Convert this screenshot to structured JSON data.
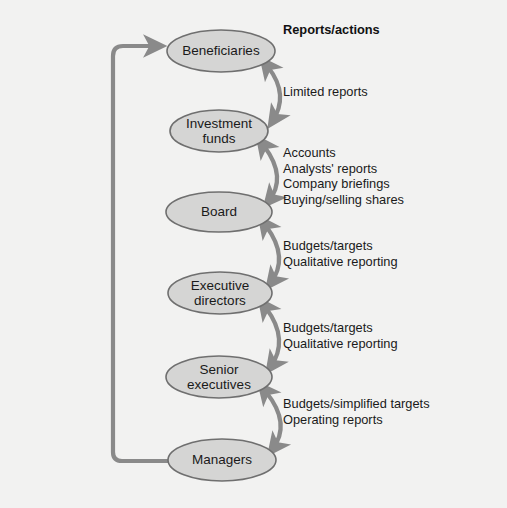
{
  "diagram": {
    "title": "Reports/actions",
    "background_color": "#f2f2f1",
    "node_fill_color": "#d5d5d4",
    "node_stroke_color": "#6f6f6f",
    "arrow_color": "#8a8a8a",
    "text_color": "#1a1a1a",
    "header": {
      "label": "Reports/actions",
      "x": 283,
      "y": 22
    },
    "nodes": [
      {
        "id": "beneficiaries",
        "label": "Beneficiaries",
        "cx": 221,
        "cy": 51,
        "rx": 54,
        "ry": 21
      },
      {
        "id": "investment-funds",
        "label": "Investment\nfunds",
        "cx": 219,
        "cy": 131,
        "rx": 49,
        "ry": 21
      },
      {
        "id": "board",
        "label": "Board",
        "cx": 219,
        "cy": 212,
        "rx": 53,
        "ry": 20
      },
      {
        "id": "executive-directors",
        "label": "Executive\ndirectors",
        "cx": 220,
        "cy": 293,
        "rx": 52,
        "ry": 21
      },
      {
        "id": "senior-executives",
        "label": "Senior\nexecutives",
        "cx": 219,
        "cy": 377,
        "rx": 53,
        "ry": 21
      },
      {
        "id": "managers",
        "label": "Managers",
        "cx": 222,
        "cy": 460,
        "rx": 54,
        "ry": 21
      }
    ],
    "edges": [
      {
        "id": "beneficiaries-investment-funds",
        "from": "beneficiaries",
        "to": "investment-funds",
        "label": "Limited reports",
        "label_x": 283,
        "label_y": 84
      },
      {
        "id": "investment-funds-board",
        "from": "investment-funds",
        "to": "board",
        "label": "Accounts\nAnalysts' reports\nCompany briefings\nBuying/selling shares",
        "label_x": 283,
        "label_y": 145
      },
      {
        "id": "board-executive-directors",
        "from": "board",
        "to": "executive-directors",
        "label": "Budgets/targets\nQualitative reporting",
        "label_x": 283,
        "label_y": 238
      },
      {
        "id": "executive-directors-senior-executives",
        "from": "executive-directors",
        "to": "senior-executives",
        "label": "Budgets/targets\nQualitative reporting",
        "label_x": 283,
        "label_y": 320
      },
      {
        "id": "senior-executives-managers",
        "from": "senior-executives",
        "to": "managers",
        "label": "Budgets/simplified targets\nOperating reports",
        "label_x": 283,
        "label_y": 396
      }
    ],
    "feedback_edge": {
      "id": "managers-to-beneficiaries",
      "from": "managers",
      "to": "beneficiaries",
      "label": ""
    }
  }
}
